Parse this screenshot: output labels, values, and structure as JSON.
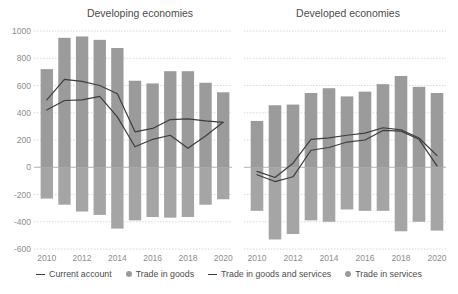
{
  "chart_data": {
    "type": "bar",
    "title": "",
    "panels": [
      {
        "title": "Developing economies",
        "xlabel": "",
        "ylabel": "",
        "ylim": [
          -600,
          1000
        ],
        "ytick_values": [
          1000,
          800,
          600,
          400,
          200,
          0,
          -200,
          -400,
          -600
        ],
        "ytick_labels": [
          "1000",
          "800",
          "600",
          "400",
          "200",
          "0",
          "-200",
          "-400",
          "-600"
        ],
        "x": [
          2010,
          2011,
          2012,
          2013,
          2014,
          2015,
          2016,
          2017,
          2018,
          2019,
          2020
        ],
        "xtick_values": [
          2010,
          2012,
          2014,
          2016,
          2018,
          2020
        ],
        "xtick_labels": [
          "2010",
          "2012",
          "2014",
          "2016",
          "2018",
          "2020"
        ],
        "series": [
          {
            "name": "Trade in goods",
            "type": "bar",
            "values": [
              720,
              950,
              960,
              935,
              875,
              635,
              615,
              705,
              705,
              620,
              550
            ]
          },
          {
            "name": "Trade in services",
            "type": "bar",
            "values": [
              -230,
              -275,
              -325,
              -350,
              -450,
              -390,
              -365,
              -370,
              -365,
              -275,
              -235
            ]
          },
          {
            "name": "Current account",
            "type": "line",
            "values": [
              420,
              490,
              495,
              520,
              370,
              150,
              205,
              235,
              140,
              230,
              330
            ]
          },
          {
            "name": "Trade in goods and services",
            "type": "line",
            "values": [
              495,
              645,
              630,
              600,
              540,
              260,
              285,
              350,
              355,
              340,
              330
            ]
          }
        ]
      },
      {
        "title": "Developed economies",
        "xlabel": "",
        "ylabel": "",
        "ylim": [
          -600,
          1000
        ],
        "ytick_values": [
          1000,
          800,
          600,
          400,
          200,
          0,
          -200,
          -400,
          -600
        ],
        "ytick_labels": [
          "1000",
          "800",
          "600",
          "400",
          "200",
          "0",
          "-200",
          "-400",
          "-600"
        ],
        "x": [
          2010,
          2011,
          2012,
          2013,
          2014,
          2015,
          2016,
          2017,
          2018,
          2019,
          2020
        ],
        "xtick_values": [
          2010,
          2012,
          2014,
          2016,
          2018,
          2020
        ],
        "xtick_labels": [
          "2010",
          "2012",
          "2014",
          "2016",
          "2018",
          "2020"
        ],
        "series": [
          {
            "name": "Trade in goods",
            "type": "bar",
            "values": [
              340,
              455,
              460,
              545,
              580,
              520,
              555,
              610,
              670,
              590,
              545
            ]
          },
          {
            "name": "Trade in services",
            "type": "bar",
            "values": [
              -320,
              -530,
              -490,
              -390,
              -400,
              -310,
              -320,
              -320,
              -470,
              -400,
              -465
            ]
          },
          {
            "name": "Current account",
            "type": "line",
            "values": [
              -55,
              -105,
              -70,
              125,
              145,
              185,
              200,
              270,
              265,
              205,
              10
            ]
          },
          {
            "name": "Trade in goods and services",
            "type": "line",
            "values": [
              -30,
              -75,
              30,
              205,
              215,
              235,
              250,
              290,
              275,
              215,
              85
            ]
          }
        ]
      }
    ],
    "legend": [
      {
        "label": "Current account",
        "marker": "line",
        "color": "#3d3d3d"
      },
      {
        "label": "Trade in goods",
        "marker": "dot",
        "color": "#9b9b9b"
      },
      {
        "label": "Trade in goods and services",
        "marker": "line",
        "color": "#3d3d3d"
      },
      {
        "label": "Trade in services",
        "marker": "dot",
        "color": "#9b9b9b"
      }
    ],
    "legend_position": "bottom",
    "grid": true,
    "colors": {
      "bar_goods": "#9b9b9b",
      "bar_services": "#a5a5a5",
      "line": "#3d3d3d",
      "grid": "#d8d8d8",
      "zero_line": "#b0b0b0",
      "text": "#4d4d4d",
      "tick_text": "#8d8d8d",
      "background": "#ffffff"
    }
  }
}
